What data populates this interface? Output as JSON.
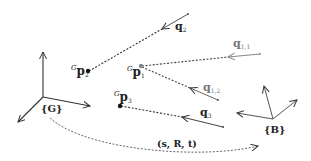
{
  "diagram": {
    "type": "coordinate-frame-registration",
    "frames": [
      {
        "id": "G",
        "label": "{G}",
        "origin": [
          43,
          97
        ]
      },
      {
        "id": "B",
        "label": "{B}",
        "origin": [
          273,
          119
        ]
      }
    ],
    "points": [
      {
        "id": "p1",
        "label_main": "p",
        "label_sup": "G",
        "label_sub": "1",
        "color": "#888888"
      },
      {
        "id": "p2",
        "label_main": "p",
        "label_sup": "G",
        "label_sub": "2",
        "color": "#111111"
      },
      {
        "id": "p3",
        "label_main": "p",
        "label_sup": "G",
        "label_sub": "3",
        "color": "#111111"
      }
    ],
    "bearings": [
      {
        "id": "q2",
        "label_main": "q",
        "label_sub": "2",
        "color": "#555555"
      },
      {
        "id": "q11",
        "label_main": "q",
        "label_sub": "1,1",
        "color": "#888888"
      },
      {
        "id": "q12",
        "label_main": "q",
        "label_sub": "1,2",
        "color": "#777777"
      },
      {
        "id": "q3",
        "label_main": "q",
        "label_sub": "3",
        "color": "#444444"
      }
    ],
    "transform": {
      "label": "(s, R, t)"
    }
  }
}
